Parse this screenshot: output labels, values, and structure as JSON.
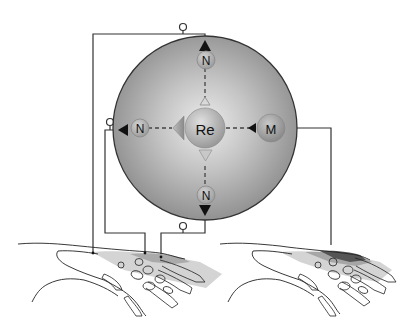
{
  "diagram": {
    "type": "schematic",
    "nodes": {
      "center": {
        "label": "Re"
      },
      "top": {
        "label": "N"
      },
      "left": {
        "label": "N"
      },
      "bottom": {
        "label": "N"
      },
      "right": {
        "label": "M"
      }
    },
    "hands": [
      {
        "name": "left-hand",
        "shading": "light-medium"
      },
      {
        "name": "right-hand",
        "shading": "light-medium-dark"
      }
    ],
    "colors": {
      "big_circle_center": "#e6e6e6",
      "big_circle_edge": "#8f8f8f",
      "outline": "#222222",
      "node_fill": "#b8b8b8",
      "shade_light": "#d2d2d2",
      "shade_mid": "#a8a8a8",
      "shade_dark": "#555555"
    }
  }
}
